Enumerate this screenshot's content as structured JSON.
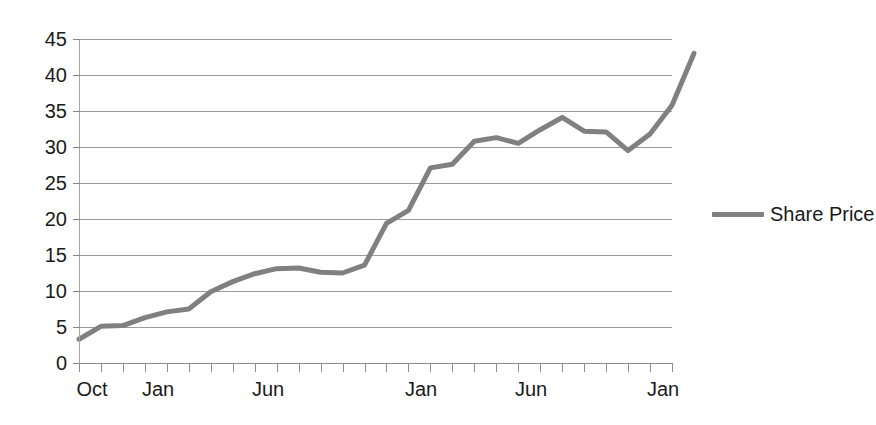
{
  "chart_data": {
    "type": "line",
    "title": "",
    "xlabel": "",
    "ylabel": "",
    "ylim": [
      0,
      45
    ],
    "y_ticks": [
      0,
      5,
      10,
      15,
      20,
      25,
      30,
      35,
      40,
      45
    ],
    "grid": "horizontal",
    "legend_position": "right",
    "legend": [
      "Share Price"
    ],
    "x_tick_count": 28,
    "x_tick_labels": [
      {
        "index": 0,
        "label": "Oct"
      },
      {
        "index": 3,
        "label": "Jan"
      },
      {
        "index": 8,
        "label": "Jun"
      },
      {
        "index": 15,
        "label": "Jan"
      },
      {
        "index": 20,
        "label": "Jun"
      },
      {
        "index": 26,
        "label": "Jan"
      }
    ],
    "series": [
      {
        "name": "Share Price",
        "color": "#808080",
        "x": [
          0,
          1,
          2,
          3,
          4,
          5,
          6,
          7,
          8,
          9,
          10,
          11,
          12,
          13,
          14,
          15,
          16,
          17,
          18,
          19,
          20,
          21,
          22,
          23,
          24,
          25,
          26,
          27
        ],
        "values": [
          3.3,
          5.1,
          5.2,
          6.3,
          7.1,
          7.5,
          9.9,
          11.3,
          12.4,
          13.1,
          13.2,
          12.6,
          12.5,
          13.6,
          19.4,
          21.2,
          27.1,
          27.6,
          30.8,
          31.3,
          30.5,
          32.4,
          34.1,
          32.2,
          32.1,
          29.5,
          31.8,
          35.8
        ],
        "last_value": 43.0
      }
    ]
  },
  "legend": {
    "series_label": "Share Price",
    "swatch_color": "#808080"
  },
  "axes": {
    "y_labels": [
      "45",
      "40",
      "35",
      "30",
      "25",
      "20",
      "15",
      "10",
      "5",
      "0"
    ],
    "x_labels": [
      "Oct",
      "Jan",
      "Jun",
      "Jan",
      "Jun",
      "Jan"
    ]
  }
}
